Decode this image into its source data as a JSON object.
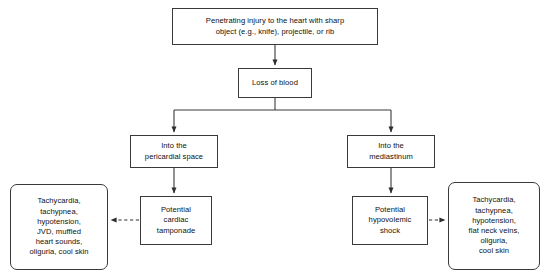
{
  "diagram": {
    "background_color": "#ffffff",
    "line_color": "#3a3a3a",
    "text_color": "#101010",
    "nodes": {
      "injury": {
        "label": "Penetrating injury to the heart with sharp\nobject (e.g., knife), projectile, or rib",
        "shape": "rectangle"
      },
      "blood_loss": {
        "label": "Loss of blood",
        "shape": "rectangle"
      },
      "pericardial": {
        "label": "Into the\npericardial space",
        "shape": "rectangle"
      },
      "mediastinum": {
        "label": "Into the\nmediastinum",
        "shape": "rectangle"
      },
      "tamponade": {
        "label": "Potential\ncardiac\ntamponade",
        "shape": "rectangle"
      },
      "hypovolemic": {
        "label": "Potential\nhypovolemic\nshock",
        "shape": "rectangle"
      },
      "left_signs": {
        "label": "Tachycardia,\ntachypnea,\nhypotension,\nJVD, muffled\nheart sounds,\noliguria, cool skin",
        "shape": "rounded-rectangle"
      },
      "right_signs": {
        "label": "Tachycardia,\ntachypnea,\nhypotension,\nflat neck veins,\noliguria,\ncool skin",
        "shape": "rounded-rectangle"
      }
    },
    "connectors": [
      {
        "from": "injury",
        "to": "blood_loss",
        "style": "solid",
        "arrow": "down"
      },
      {
        "from": "blood_loss",
        "to": "pericardial",
        "style": "solid",
        "arrow": "down"
      },
      {
        "from": "blood_loss",
        "to": "mediastinum",
        "style": "solid",
        "arrow": "down"
      },
      {
        "from": "pericardial",
        "to": "tamponade",
        "style": "solid",
        "arrow": "down"
      },
      {
        "from": "mediastinum",
        "to": "hypovolemic",
        "style": "solid",
        "arrow": "down"
      },
      {
        "from": "tamponade",
        "to": "left_signs",
        "style": "dashed",
        "arrow": "left"
      },
      {
        "from": "hypovolemic",
        "to": "right_signs",
        "style": "dashed",
        "arrow": "right"
      }
    ]
  }
}
